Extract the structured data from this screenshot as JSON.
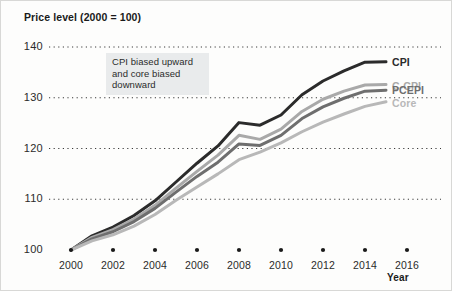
{
  "chart_data": {
    "type": "line",
    "title": "Price level (2000 = 100)",
    "xlabel": "Year",
    "ylabel": "",
    "xlim": [
      2000,
      2016
    ],
    "ylim": [
      100,
      140
    ],
    "grid": true,
    "grid_style": "dotted-horizontal",
    "legend_position": "right-inline-end-of-line",
    "xticks": [
      "2000",
      "2002",
      "2004",
      "2006",
      "2008",
      "2010",
      "2012",
      "2014",
      "2016"
    ],
    "xtick_values": [
      2000,
      2002,
      2004,
      2006,
      2008,
      2010,
      2012,
      2014,
      2016
    ],
    "yticks": [
      "100",
      "110",
      "120",
      "130",
      "140"
    ],
    "ytick_values": [
      100,
      110,
      120,
      130,
      140
    ],
    "x": [
      2000,
      2001,
      2002,
      2003,
      2004,
      2005,
      2006,
      2007,
      2008,
      2009,
      2010,
      2011,
      2012,
      2013,
      2014,
      2015
    ],
    "series": [
      {
        "name": "CPI",
        "color": "#2b2b2b",
        "width": 3.0,
        "values": [
          100.0,
          102.8,
          104.5,
          106.8,
          109.7,
          113.4,
          117.1,
          120.5,
          125.1,
          124.6,
          126.6,
          130.6,
          133.3,
          135.3,
          137.0,
          137.1
        ]
      },
      {
        "name": "C-CPI",
        "color": "#a9a9a9",
        "width": 3.0,
        "values": [
          100.0,
          102.5,
          104.0,
          106.1,
          108.8,
          112.2,
          115.5,
          118.7,
          122.6,
          121.8,
          123.8,
          127.3,
          129.7,
          131.3,
          132.5,
          132.6
        ]
      },
      {
        "name": "PCEPI",
        "color": "#6e6e6e",
        "width": 3.0,
        "values": [
          100.0,
          102.2,
          103.6,
          105.6,
          108.2,
          111.4,
          114.5,
          117.3,
          120.9,
          120.6,
          122.6,
          125.9,
          128.2,
          129.9,
          131.3,
          131.5
        ]
      },
      {
        "name": "Core",
        "color": "#b8b8b8",
        "width": 3.0,
        "values": [
          100.0,
          101.8,
          103.0,
          104.7,
          107.0,
          109.8,
          112.4,
          115.0,
          117.8,
          119.3,
          121.1,
          123.3,
          125.2,
          126.8,
          128.3,
          129.2
        ]
      }
    ],
    "annotation": {
      "lines": [
        "CPI biased upward",
        "and core biased",
        "downward"
      ],
      "background": "#e9ebec"
    },
    "baseline_markers": {
      "shape": "dot",
      "color": "#1a1a1a",
      "at_years": [
        2000,
        2002,
        2004,
        2006,
        2008,
        2010,
        2012,
        2014,
        2016
      ],
      "at_value": 100
    }
  }
}
